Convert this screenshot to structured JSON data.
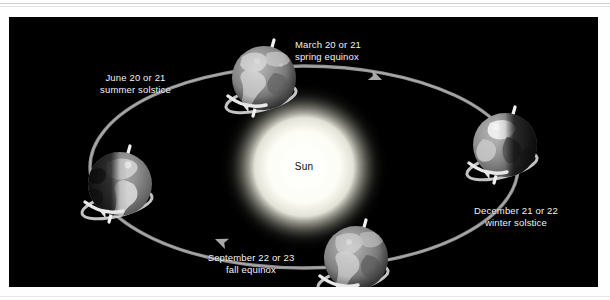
{
  "figure": {
    "background_color": "#000000",
    "page_color": "#ffffff",
    "label_color": "#f2f2f2",
    "orbit_color": "#9a9a9a",
    "sun_color": "#ffffff",
    "sun_label": "Sun"
  },
  "positions": [
    {
      "id": "spring-equinox",
      "date": "March 20 or 21",
      "season": "spring equinox",
      "label_x": 286,
      "label_y": 22,
      "label_align": "left",
      "earth_cx": 255,
      "earth_cy": 61,
      "earth_r": 32,
      "lit_side": "full",
      "axis_tilt_deg": -17
    },
    {
      "id": "summer-solstice",
      "date": "June 20 or 21",
      "season": "summer solstice",
      "label_x": 69,
      "label_y": 55,
      "label_align": "center",
      "earth_cx": 111,
      "earth_cy": 167,
      "earth_r": 32,
      "lit_side": "right",
      "axis_tilt_deg": -17
    },
    {
      "id": "fall-equinox",
      "date": "September 22 or 23",
      "season": "fall equinox",
      "label_x": 184,
      "label_y": 252,
      "label_align": "center",
      "earth_cx": 347,
      "earth_cy": 241,
      "earth_r": 32,
      "lit_side": "full",
      "axis_tilt_deg": -17
    },
    {
      "id": "winter-solstice",
      "date": "December 21 or 22",
      "season": "winter solstice",
      "label_x": 457,
      "label_y": 206,
      "label_align": "center",
      "earth_cx": 496,
      "earth_cy": 128,
      "earth_r": 32,
      "lit_side": "left",
      "axis_tilt_deg": -17
    }
  ],
  "sun": {
    "cx": 295,
    "cy": 150,
    "radius": 62,
    "label": "Sun",
    "label_x": 295,
    "label_y": 150
  },
  "orbit": {
    "cx": 295,
    "cy": 150,
    "rx": 214,
    "ry": 101,
    "direction": "counterclockwise",
    "arrows": [
      {
        "x": 373,
        "y": 63,
        "rotation": 205
      },
      {
        "x": 206,
        "y": 222,
        "rotation": 25
      }
    ]
  }
}
